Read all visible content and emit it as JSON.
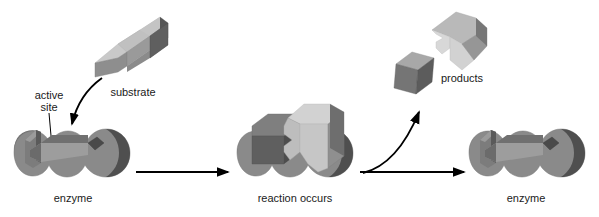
{
  "diagram": {
    "type": "process-diagram",
    "canvas": {
      "width": 599,
      "height": 217,
      "background": "#ffffff"
    }
  },
  "labels": {
    "active_site": "active\nsite",
    "active_site_line1": "active",
    "active_site_line2": "site",
    "substrate": "substrate",
    "enzyme_left": "enzyme",
    "reaction_occurs": "reaction occurs",
    "products": "products",
    "enzyme_right": "enzyme"
  },
  "stages": [
    {
      "id": "stage-1",
      "caption": "enzyme",
      "note": "Free enzyme with empty active site; substrate approaching"
    },
    {
      "id": "stage-2",
      "caption": "reaction occurs",
      "note": "Enzyme-substrate complex; substrate bound in active site"
    },
    {
      "id": "stage-3",
      "caption": "enzyme",
      "note": "Enzyme released unchanged after products leave"
    }
  ],
  "arrows": [
    {
      "id": "arrow-substrate-to-site",
      "kind": "curved",
      "direction": "down-left",
      "label": ""
    },
    {
      "id": "arrow-pointer-active-site",
      "kind": "leader-line",
      "direction": "down",
      "label": ""
    },
    {
      "id": "arrow-stage1-to-stage2",
      "kind": "straight",
      "direction": "right",
      "label": ""
    },
    {
      "id": "arrow-stage2-to-stage3",
      "kind": "straight",
      "direction": "right",
      "label": ""
    },
    {
      "id": "arrow-products-release",
      "kind": "curved",
      "direction": "up-right",
      "label": ""
    }
  ],
  "colors": {
    "background": "#ffffff",
    "text": "#1a1a1a",
    "arrow": "#000000",
    "enzyme_top": "#8f8f8f",
    "enzyme_face": "#7e7e7e",
    "enzyme_shadow": "#5d5d5d",
    "enzyme_dark_edge": "#4a4a4a",
    "substrate_light": "#c9c9c9",
    "substrate_mid": "#9a9a9a",
    "substrate_dark": "#5a5a5a",
    "product_cube_light": "#a8a8a8",
    "product_cube_dark": "#6e6e6e",
    "product_wedge_light": "#d6d6d6",
    "product_wedge_mid": "#aeaeae",
    "product_wedge_dark": "#8a8a8a"
  }
}
